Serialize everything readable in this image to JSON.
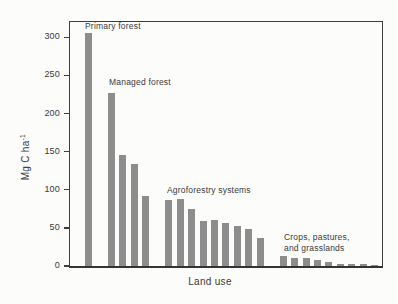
{
  "figure": {
    "xlabel": "Land use",
    "ylabel_base": "Mg C ha",
    "ylabel_exponent": "-1",
    "ylabel_full": "Mg C ha⁻¹"
  },
  "chart_data": {
    "type": "bar",
    "title": "",
    "xlabel": "Land use",
    "ylabel": "Mg C ha⁻¹",
    "ylim": [
      0,
      320
    ],
    "yticks": [
      0,
      50,
      100,
      150,
      200,
      250,
      300
    ],
    "grid": false,
    "legend": "none (groups labeled by in-plot annotations)",
    "bar_color": "#8d8d8d",
    "frame_color": "#3e3e3e",
    "groups": [
      {
        "label": "Primary forest",
        "values": [
          305
        ]
      },
      {
        "label": "Managed forest",
        "values": [
          227,
          146,
          134,
          92
        ]
      },
      {
        "label": "Agroforestry systems",
        "values": [
          87,
          88,
          75,
          59,
          60,
          57,
          53,
          49,
          37
        ]
      },
      {
        "label": "Crops, pastures,\nand grasslands",
        "values": [
          13,
          10,
          10,
          8,
          5,
          3,
          2,
          2,
          1
        ]
      }
    ]
  }
}
